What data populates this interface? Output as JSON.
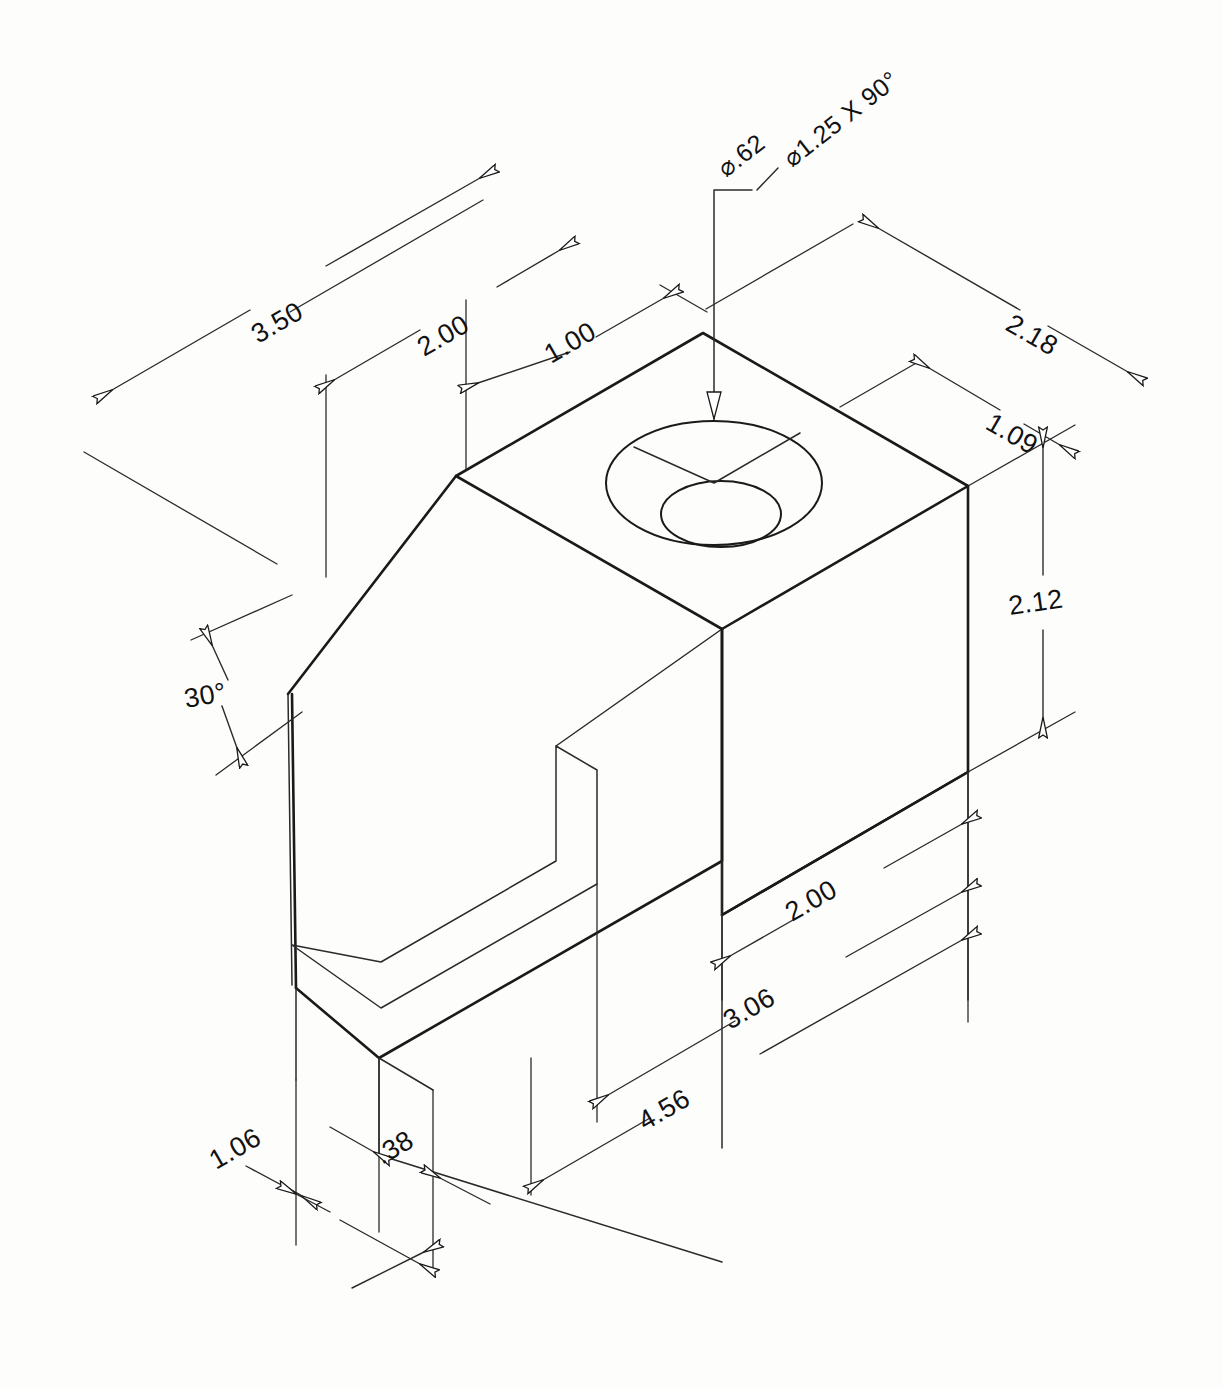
{
  "drawing": {
    "type": "isometric-mechanical-drawing",
    "title": "Isometric pictorial of a machined block with countersunk hole",
    "background_color": "#fdfdfc",
    "line_color": "#1a1a1a",
    "units": "inches"
  },
  "callouts": [
    {
      "id": "hole-dia",
      "label": "⌀.62",
      "kind": "hole-diameter"
    },
    {
      "id": "counterbore",
      "label": "⌀1.25 X 90°",
      "kind": "countersink-spec"
    }
  ],
  "dimensions": [
    {
      "id": "dim-3-50",
      "label": "3.50",
      "orientation": "iso-left-up",
      "kind": "linear"
    },
    {
      "id": "dim-2-00-top",
      "label": "2.00",
      "orientation": "iso-left-up",
      "kind": "linear"
    },
    {
      "id": "dim-1-00",
      "label": "1.00",
      "orientation": "iso-left-up",
      "kind": "linear"
    },
    {
      "id": "dim-2-18",
      "label": "2.18",
      "orientation": "iso-right-down",
      "kind": "linear"
    },
    {
      "id": "dim-1-09",
      "label": "1.09",
      "orientation": "iso-right-down",
      "kind": "linear"
    },
    {
      "id": "dim-2-12",
      "label": "2.12",
      "orientation": "vertical",
      "kind": "linear"
    },
    {
      "id": "dim-2-00-side",
      "label": "2.00",
      "orientation": "iso-right-up",
      "kind": "linear"
    },
    {
      "id": "dim-3-06",
      "label": "3.06",
      "orientation": "iso-right-up",
      "kind": "linear"
    },
    {
      "id": "dim-4-56",
      "label": "4.56",
      "orientation": "iso-right-up",
      "kind": "linear"
    },
    {
      "id": "dim-0-38",
      "label": ".38",
      "orientation": "iso-right-up",
      "kind": "linear"
    },
    {
      "id": "dim-1-06",
      "label": "1.06",
      "orientation": "iso-right-up",
      "kind": "linear"
    },
    {
      "id": "dim-30deg",
      "label": "30°",
      "orientation": "vertical",
      "kind": "angular"
    }
  ]
}
